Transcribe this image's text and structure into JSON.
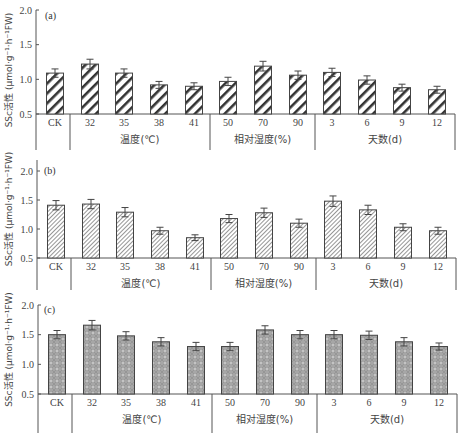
{
  "chart_data": [
    {
      "type": "bar",
      "panel": "(a)",
      "ylabel": "SSc活性 (μmol·g⁻¹·h⁻¹FW)",
      "ylim": [
        0.5,
        2.0
      ],
      "yticks": [
        0.5,
        1.0,
        1.5,
        2.0
      ],
      "grid": false,
      "categories": [
        "CK",
        "32",
        "35",
        "38",
        "41",
        "50",
        "70",
        "90",
        "3",
        "6",
        "9",
        "12"
      ],
      "groups": [
        {
          "label": "",
          "categories": [
            "CK"
          ]
        },
        {
          "label": "温度(℃)",
          "categories": [
            "32",
            "35",
            "38",
            "41"
          ]
        },
        {
          "label": "相对湿度(%)",
          "categories": [
            "50",
            "70",
            "90"
          ]
        },
        {
          "label": "天数(d)",
          "categories": [
            "3",
            "6",
            "9",
            "12"
          ]
        }
      ],
      "values": [
        1.09,
        1.22,
        1.09,
        0.92,
        0.9,
        0.97,
        1.19,
        1.06,
        1.1,
        0.99,
        0.88,
        0.85
      ],
      "errors": [
        0.06,
        0.07,
        0.06,
        0.05,
        0.05,
        0.06,
        0.07,
        0.06,
        0.06,
        0.06,
        0.05,
        0.05
      ],
      "pattern": "bold-diagonal-hatch"
    },
    {
      "type": "bar",
      "panel": "(b)",
      "ylabel": "SSc活性 (μmol·g⁻¹·h⁻¹FW)",
      "ylim": [
        0.5,
        2.2
      ],
      "yticks": [
        0.5,
        1.0,
        1.5,
        2.0
      ],
      "grid": false,
      "categories": [
        "CK",
        "32",
        "35",
        "38",
        "41",
        "50",
        "70",
        "90",
        "3",
        "6",
        "9",
        "12"
      ],
      "groups": [
        {
          "label": "",
          "categories": [
            "CK"
          ]
        },
        {
          "label": "温度(℃)",
          "categories": [
            "32",
            "35",
            "38",
            "41"
          ]
        },
        {
          "label": "相对湿度(%)",
          "categories": [
            "50",
            "70",
            "90"
          ]
        },
        {
          "label": "天数(d)",
          "categories": [
            "3",
            "6",
            "9",
            "12"
          ]
        }
      ],
      "values": [
        1.41,
        1.43,
        1.29,
        0.97,
        0.85,
        1.18,
        1.28,
        1.1,
        1.48,
        1.33,
        1.03,
        0.97
      ],
      "errors": [
        0.08,
        0.08,
        0.08,
        0.06,
        0.05,
        0.07,
        0.08,
        0.07,
        0.09,
        0.08,
        0.06,
        0.06
      ],
      "pattern": "fine-diagonal-hatch"
    },
    {
      "type": "bar",
      "panel": "(c)",
      "ylabel": "SSc活性 (μmol·g⁻¹·h⁻¹FW)",
      "ylim": [
        0.5,
        2.0
      ],
      "yticks": [
        0.5,
        1.0,
        1.5,
        2.0
      ],
      "grid": false,
      "categories": [
        "CK",
        "32",
        "35",
        "38",
        "41",
        "50",
        "70",
        "90",
        "3",
        "6",
        "9",
        "12"
      ],
      "groups": [
        {
          "label": "",
          "categories": [
            "CK"
          ]
        },
        {
          "label": "温度(℃)",
          "categories": [
            "32",
            "35",
            "38",
            "41"
          ]
        },
        {
          "label": "相对湿度(%)",
          "categories": [
            "50",
            "70",
            "90"
          ]
        },
        {
          "label": "天数(d)",
          "categories": [
            "3",
            "6",
            "9",
            "12"
          ]
        }
      ],
      "values": [
        1.5,
        1.66,
        1.48,
        1.38,
        1.3,
        1.3,
        1.58,
        1.5,
        1.5,
        1.49,
        1.38,
        1.3
      ],
      "errors": [
        0.07,
        0.08,
        0.07,
        0.07,
        0.07,
        0.07,
        0.07,
        0.07,
        0.07,
        0.07,
        0.07,
        0.06
      ],
      "pattern": "grey-crosshatch-dots"
    }
  ],
  "panels": [
    {
      "tag": "(a)"
    },
    {
      "tag": "(b)"
    },
    {
      "tag": "(c)"
    }
  ],
  "colors": {
    "axis": "#555555",
    "bar_edge": "#444444",
    "hatch_a": "#333333",
    "hatch_b": "#888888",
    "fill_c": "#a9a9a9"
  }
}
